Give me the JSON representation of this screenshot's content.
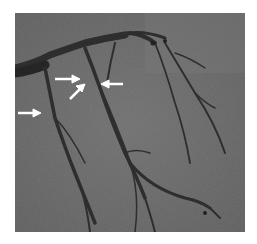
{
  "image": {
    "type": "coronary angiogram",
    "background_color": "#6a6a6a",
    "vessel_color": "#2e2e2e",
    "arrow_color": "#ffffff",
    "arrows": [
      {
        "name": "arrow-left-upper",
        "direction": "right",
        "tip": [
          78,
          67
        ]
      },
      {
        "name": "arrow-diagonal",
        "direction": "up-right",
        "tip": [
          83,
          72
        ]
      },
      {
        "name": "arrow-right-upper",
        "direction": "left",
        "tip": [
          88,
          71
        ]
      },
      {
        "name": "arrow-left-lower",
        "direction": "right",
        "tip": [
          27,
          100
        ]
      }
    ]
  }
}
